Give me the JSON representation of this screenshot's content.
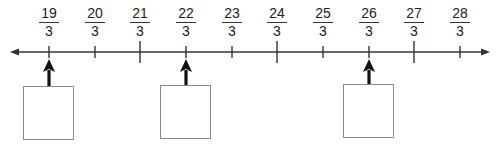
{
  "number_line": {
    "left_x": 10,
    "right_x": 490,
    "y": 52,
    "line_color": "#333333",
    "ticks": [
      {
        "x": 49,
        "numerator": "19",
        "denominator": "3",
        "major": false
      },
      {
        "x": 95,
        "numerator": "20",
        "denominator": "3",
        "major": false
      },
      {
        "x": 140,
        "numerator": "21",
        "denominator": "3",
        "major": true
      },
      {
        "x": 186,
        "numerator": "22",
        "denominator": "3",
        "major": false
      },
      {
        "x": 232,
        "numerator": "23",
        "denominator": "3",
        "major": false
      },
      {
        "x": 277,
        "numerator": "24",
        "denominator": "3",
        "major": true
      },
      {
        "x": 323,
        "numerator": "25",
        "denominator": "3",
        "major": false
      },
      {
        "x": 369,
        "numerator": "26",
        "denominator": "3",
        "major": false
      },
      {
        "x": 414,
        "numerator": "27",
        "denominator": "3",
        "major": true
      },
      {
        "x": 460,
        "numerator": "28",
        "denominator": "3",
        "major": false
      }
    ]
  },
  "pointers": [
    {
      "points_to": "19/3",
      "x": 49
    },
    {
      "points_to": "22/3",
      "x": 186
    },
    {
      "points_to": "26/3",
      "x": 369
    }
  ],
  "answer_boxes": [
    {
      "left": 23,
      "top": 86,
      "value": ""
    },
    {
      "left": 160,
      "top": 85,
      "value": ""
    },
    {
      "left": 343,
      "top": 84,
      "value": ""
    }
  ]
}
